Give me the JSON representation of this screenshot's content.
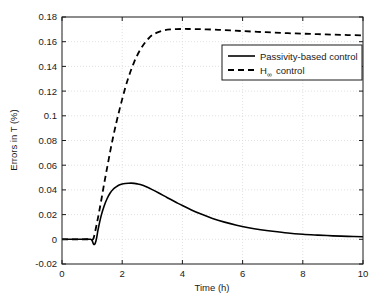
{
  "chart_data": {
    "type": "line",
    "title": "",
    "xlabel": "Time (h)",
    "ylabel": "Errors in T (%)",
    "xlim": [
      0,
      10
    ],
    "ylim": [
      -0.02,
      0.18
    ],
    "xticks": [
      "0",
      "2",
      "4",
      "6",
      "8",
      "10"
    ],
    "xtick_values": [
      0,
      2,
      4,
      6,
      8,
      10
    ],
    "yticks": [
      "-0.02",
      "0",
      "0.02",
      "0.04",
      "0.06",
      "0.08",
      "0.1",
      "0.12",
      "0.14",
      "0.16",
      "0.18"
    ],
    "ytick_values": [
      -0.02,
      0,
      0.02,
      0.04,
      0.06,
      0.08,
      0.1,
      0.12,
      0.14,
      0.16,
      0.18
    ],
    "grid": true,
    "grid_color": "#d9d9d9",
    "axis_color": "#1a1a1a",
    "legend_position": "upper right",
    "series": [
      {
        "name": "Passivity-based control",
        "style": "solid",
        "color": "#000000",
        "x": [
          0.0,
          0.2,
          0.4,
          0.6,
          0.8,
          0.95,
          1.0,
          1.05,
          1.1,
          1.15,
          1.2,
          1.3,
          1.4,
          1.5,
          1.6,
          1.7,
          1.8,
          1.9,
          2.0,
          2.1,
          2.2,
          2.3,
          2.4,
          2.5,
          2.6,
          2.8,
          3.0,
          3.2,
          3.5,
          3.8,
          4.0,
          4.3,
          4.6,
          5.0,
          5.4,
          5.8,
          6.2,
          6.6,
          7.0,
          7.5,
          8.0,
          8.5,
          9.0,
          9.5,
          10.0
        ],
        "y": [
          0.0,
          0.0,
          0.0,
          0.0,
          0.0,
          0.0,
          -0.001,
          -0.004,
          -0.0035,
          0.001,
          0.008,
          0.019,
          0.027,
          0.033,
          0.0375,
          0.0405,
          0.0425,
          0.044,
          0.0448,
          0.0452,
          0.0454,
          0.0455,
          0.0453,
          0.0449,
          0.0443,
          0.0425,
          0.0402,
          0.0377,
          0.0337,
          0.0298,
          0.0273,
          0.0238,
          0.0206,
          0.0169,
          0.0139,
          0.0114,
          0.0094,
          0.0078,
          0.0065,
          0.0051,
          0.0041,
          0.0034,
          0.0028,
          0.0024,
          0.0021
        ]
      },
      {
        "name": "H∞ control",
        "name_base": "H",
        "name_sub": "∞",
        "name_rest": "control",
        "style": "dashed",
        "color": "#000000",
        "x": [
          0.0,
          0.3,
          0.6,
          0.9,
          1.0,
          1.05,
          1.1,
          1.2,
          1.3,
          1.4,
          1.5,
          1.6,
          1.7,
          1.8,
          1.9,
          2.0,
          2.1,
          2.2,
          2.3,
          2.4,
          2.5,
          2.6,
          2.7,
          2.8,
          2.9,
          3.0,
          3.2,
          3.4,
          3.6,
          3.8,
          4.0,
          4.2,
          4.5,
          4.8,
          5.2,
          5.6,
          6.0,
          6.5,
          7.0,
          7.5,
          8.0,
          8.5,
          9.0,
          9.5,
          10.0
        ],
        "y": [
          0.0,
          0.0,
          0.0,
          0.0,
          -0.0005,
          0.001,
          0.006,
          0.018,
          0.031,
          0.045,
          0.058,
          0.071,
          0.083,
          0.094,
          0.104,
          0.1135,
          0.1225,
          0.1305,
          0.1375,
          0.1437,
          0.149,
          0.1535,
          0.1573,
          0.1605,
          0.1632,
          0.1653,
          0.1678,
          0.1692,
          0.1699,
          0.1702,
          0.1703,
          0.1703,
          0.1702,
          0.17,
          0.1696,
          0.1691,
          0.1686,
          0.168,
          0.1674,
          0.1669,
          0.1665,
          0.1661,
          0.1657,
          0.1654,
          0.1651
        ]
      }
    ]
  },
  "legend": {
    "items": [
      {
        "label": "Passivity-based control",
        "style": "solid"
      },
      {
        "label_base": "H",
        "label_sub": "∞",
        "label_rest": "control",
        "style": "dashed"
      }
    ]
  },
  "axes": {
    "xlabel": "Time (h)",
    "ylabel": "Errors in T (%)"
  }
}
